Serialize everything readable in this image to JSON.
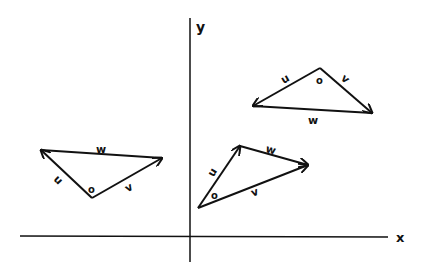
{
  "axes": {
    "x_label": "x",
    "y_label": "y"
  },
  "triangles": [
    {
      "name": "left",
      "u": "u",
      "v": "v",
      "w": "w",
      "origin": "o"
    },
    {
      "name": "middle",
      "u": "u",
      "v": "v",
      "w": "w",
      "origin": "o"
    },
    {
      "name": "right",
      "u": "u",
      "v": "v",
      "w": "w",
      "origin": "o"
    }
  ],
  "colors": {
    "stroke": "#111111",
    "background": "#ffffff"
  }
}
